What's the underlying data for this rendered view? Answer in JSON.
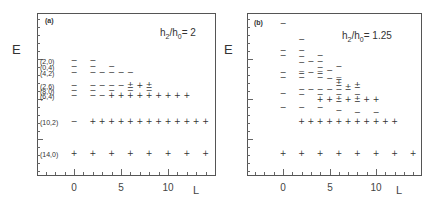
{
  "figure": {
    "panels": [
      {
        "tag": "(a)",
        "ratio_label": {
          "h": "h",
          "sub2": "2",
          "slash": "/h",
          "sub0": "0",
          "value": "= 2"
        },
        "ylabel": "E",
        "xlabel": "L",
        "x_ticks": [
          "0",
          "5",
          "10"
        ]
      },
      {
        "tag": "(b)",
        "ratio_label": {
          "h": "h",
          "sub2": "2",
          "slash": "/h",
          "sub0": "0",
          "value": "= 1.25"
        },
        "ylabel": "E",
        "xlabel": "L",
        "x_ticks": [
          "0",
          "5",
          "10"
        ]
      }
    ]
  },
  "chart_data": [
    {
      "type": "scatter",
      "title": "(a) h2/h0 = 2",
      "xlabel": "L",
      "ylabel": "E",
      "xlim": [
        -4,
        15
      ],
      "x_ticks": [
        0,
        5,
        10
      ],
      "legend": {
        "-": "negative parity / state marker",
        "+": "positive marker",
        "±": "both"
      },
      "bands": [
        {
          "label": "(2,0)",
          "y": 61,
          "points": [
            {
              "L": 0,
              "s": "−"
            },
            {
              "L": 2,
              "s": "−"
            }
          ]
        },
        {
          "label": "(0,4)",
          "y": 67,
          "points": [
            {
              "L": 0,
              "s": "−"
            },
            {
              "L": 2,
              "s": "−"
            },
            {
              "L": 4,
              "s": "−"
            }
          ]
        },
        {
          "label": "(4,2)",
          "y": 73,
          "points": [
            {
              "L": 0,
              "s": "−"
            },
            {
              "L": 2,
              "s": "−"
            },
            {
              "L": 3,
              "s": "−"
            },
            {
              "L": 4,
              "s": "−"
            },
            {
              "L": 5,
              "s": "−"
            },
            {
              "L": 6,
              "s": "−"
            }
          ]
        },
        {
          "label": "(2,6)",
          "y": 86,
          "points": [
            {
              "L": 0,
              "s": "−"
            },
            {
              "L": 2,
              "s": "−"
            },
            {
              "L": 3,
              "s": "−"
            },
            {
              "L": 4,
              "s": "−"
            },
            {
              "L": 5,
              "s": "−"
            },
            {
              "L": 6,
              "s": "±"
            },
            {
              "L": 7,
              "s": "+"
            },
            {
              "L": 8,
              "s": "±"
            }
          ]
        },
        {
          "label": "(8,0)",
          "y": 91,
          "points": [
            {
              "L": 0,
              "s": "−"
            },
            {
              "L": 2,
              "s": "−"
            },
            {
              "L": 4,
              "s": "−"
            },
            {
              "L": 6,
              "s": "−"
            },
            {
              "L": 8,
              "s": "−"
            }
          ]
        },
        {
          "label": "(6,4)",
          "y": 96,
          "points": [
            {
              "L": 0,
              "s": "−"
            },
            {
              "L": 2,
              "s": "−"
            },
            {
              "L": 3,
              "s": "−"
            },
            {
              "L": 4,
              "s": "+"
            },
            {
              "L": 5,
              "s": "+"
            },
            {
              "L": 6,
              "s": "+"
            },
            {
              "L": 7,
              "s": "+"
            },
            {
              "L": 8,
              "s": "+"
            },
            {
              "L": 9,
              "s": "+"
            },
            {
              "L": 10,
              "s": "+"
            },
            {
              "L": 11,
              "s": "+"
            },
            {
              "L": 12,
              "s": "+"
            }
          ]
        },
        {
          "label": "(10,2)",
          "y": 122,
          "points": [
            {
              "L": 0,
              "s": "−"
            },
            {
              "L": 2,
              "s": "+"
            },
            {
              "L": 3,
              "s": "+"
            },
            {
              "L": 4,
              "s": "+"
            },
            {
              "L": 5,
              "s": "+"
            },
            {
              "L": 6,
              "s": "+"
            },
            {
              "L": 7,
              "s": "+"
            },
            {
              "L": 8,
              "s": "+"
            },
            {
              "L": 9,
              "s": "+"
            },
            {
              "L": 10,
              "s": "+"
            },
            {
              "L": 11,
              "s": "+"
            },
            {
              "L": 12,
              "s": "+"
            },
            {
              "L": 13,
              "s": "+"
            },
            {
              "L": 14,
              "s": "+"
            }
          ]
        },
        {
          "label": "(14,0)",
          "y": 154,
          "points": [
            {
              "L": 0,
              "s": "+"
            },
            {
              "L": 2,
              "s": "+"
            },
            {
              "L": 4,
              "s": "+"
            },
            {
              "L": 6,
              "s": "+"
            },
            {
              "L": 8,
              "s": "+"
            },
            {
              "L": 10,
              "s": "+"
            },
            {
              "L": 12,
              "s": "+"
            },
            {
              "L": 14,
              "s": "+"
            }
          ]
        }
      ]
    },
    {
      "type": "scatter",
      "title": "(b) h2/h0 = 1.25",
      "xlabel": "L",
      "ylabel": "E",
      "xlim": [
        -4,
        15
      ],
      "x_ticks": [
        0,
        5,
        10
      ],
      "points": [
        {
          "L": 0,
          "y": 24,
          "s": "−"
        },
        {
          "L": 0,
          "y": 51,
          "s": "−"
        },
        {
          "L": 0,
          "y": 56,
          "s": "−"
        },
        {
          "L": 0,
          "y": 73,
          "s": "−"
        },
        {
          "L": 0,
          "y": 78,
          "s": "−"
        },
        {
          "L": 0,
          "y": 94,
          "s": "−"
        },
        {
          "L": 0,
          "y": 108,
          "s": "−"
        },
        {
          "L": 0,
          "y": 154,
          "s": "+"
        },
        {
          "L": 2,
          "y": 40,
          "s": "−"
        },
        {
          "L": 2,
          "y": 51,
          "s": "−"
        },
        {
          "L": 2,
          "y": 57,
          "s": "−"
        },
        {
          "L": 2,
          "y": 63,
          "s": "−"
        },
        {
          "L": 2,
          "y": 73,
          "s": "="
        },
        {
          "L": 2,
          "y": 78,
          "s": "−"
        },
        {
          "L": 2,
          "y": 90,
          "s": "−"
        },
        {
          "L": 2,
          "y": 95,
          "s": "−"
        },
        {
          "L": 2,
          "y": 108,
          "s": "−"
        },
        {
          "L": 2,
          "y": 122,
          "s": "+"
        },
        {
          "L": 2,
          "y": 154,
          "s": "+"
        },
        {
          "L": 3,
          "y": 62,
          "s": "−"
        },
        {
          "L": 3,
          "y": 73,
          "s": "−"
        },
        {
          "L": 3,
          "y": 90,
          "s": "−"
        },
        {
          "L": 3,
          "y": 122,
          "s": "+"
        },
        {
          "L": 4,
          "y": 56,
          "s": "−"
        },
        {
          "L": 4,
          "y": 62,
          "s": "−"
        },
        {
          "L": 4,
          "y": 68,
          "s": "−"
        },
        {
          "L": 4,
          "y": 73,
          "s": "="
        },
        {
          "L": 4,
          "y": 78,
          "s": "−"
        },
        {
          "L": 4,
          "y": 90,
          "s": "−"
        },
        {
          "L": 4,
          "y": 95,
          "s": "−"
        },
        {
          "L": 4,
          "y": 100,
          "s": "+"
        },
        {
          "L": 4,
          "y": 108,
          "s": "−"
        },
        {
          "L": 4,
          "y": 122,
          "s": "+"
        },
        {
          "L": 4,
          "y": 154,
          "s": "+"
        },
        {
          "L": 5,
          "y": 71,
          "s": "−"
        },
        {
          "L": 5,
          "y": 79,
          "s": "−"
        },
        {
          "L": 5,
          "y": 90,
          "s": "−"
        },
        {
          "L": 5,
          "y": 100,
          "s": "+"
        },
        {
          "L": 5,
          "y": 122,
          "s": "+"
        },
        {
          "L": 6,
          "y": 67,
          "s": "−"
        },
        {
          "L": 6,
          "y": 79,
          "s": "="
        },
        {
          "L": 6,
          "y": 84,
          "s": "±"
        },
        {
          "L": 6,
          "y": 90,
          "s": "−"
        },
        {
          "L": 6,
          "y": 95,
          "s": "−"
        },
        {
          "L": 6,
          "y": 100,
          "s": "±"
        },
        {
          "L": 6,
          "y": 111,
          "s": "−"
        },
        {
          "L": 6,
          "y": 122,
          "s": "+"
        },
        {
          "L": 6,
          "y": 154,
          "s": "+"
        },
        {
          "L": 7,
          "y": 88,
          "s": "±"
        },
        {
          "L": 7,
          "y": 100,
          "s": "+"
        },
        {
          "L": 7,
          "y": 122,
          "s": "+"
        },
        {
          "L": 8,
          "y": 86,
          "s": "±"
        },
        {
          "L": 8,
          "y": 95,
          "s": "−"
        },
        {
          "L": 8,
          "y": 100,
          "s": "±"
        },
        {
          "L": 8,
          "y": 113,
          "s": "−"
        },
        {
          "L": 8,
          "y": 122,
          "s": "+"
        },
        {
          "L": 8,
          "y": 154,
          "s": "+"
        },
        {
          "L": 9,
          "y": 100,
          "s": "+"
        },
        {
          "L": 9,
          "y": 122,
          "s": "+"
        },
        {
          "L": 10,
          "y": 100,
          "s": "+"
        },
        {
          "L": 10,
          "y": 113,
          "s": "−"
        },
        {
          "L": 10,
          "y": 122,
          "s": "+"
        },
        {
          "L": 10,
          "y": 154,
          "s": "+"
        },
        {
          "L": 11,
          "y": 122,
          "s": "+"
        },
        {
          "L": 12,
          "y": 122,
          "s": "+"
        },
        {
          "L": 12,
          "y": 154,
          "s": "+"
        },
        {
          "L": 14,
          "y": 154,
          "s": "+"
        }
      ]
    }
  ]
}
